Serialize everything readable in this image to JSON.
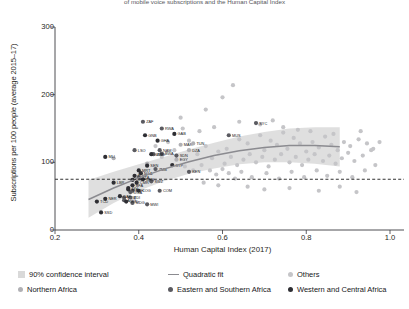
{
  "figure": {
    "title": "of mobile voice subscriptions and the Human Capital Index",
    "xlabel": "Human Capital Index (2017)",
    "ylabel": "Subscriptions per 100 people (average 2015–17)"
  },
  "colors": {
    "band": "#d9d9d9",
    "fit_line": "#8b8b90",
    "others": "#c5c5c8",
    "northern_africa": "#b0b0b4",
    "eastern_southern": "#5a5a60",
    "western_central": "#2e2e33",
    "reference_line": "#1a1a1a",
    "axis": "#3a3a3e"
  },
  "legend": {
    "row1": [
      {
        "label": "90% confidence interval",
        "marker": "swatch",
        "color": "#d9d9d9"
      },
      {
        "label": "Quadratic fit",
        "marker": "line",
        "color": "#8b8b90"
      },
      {
        "label": "Others",
        "marker": "dot",
        "color": "#c5c5c8"
      }
    ],
    "row2": [
      {
        "label": "Northern Africa",
        "marker": "dot",
        "color": "#b0b0b4"
      },
      {
        "label": "Eastern and Southern Africa",
        "marker": "dot",
        "color": "#5a5a60"
      },
      {
        "label": "Western and Central Africa",
        "marker": "dot",
        "color": "#2e2e33"
      }
    ]
  },
  "chart_data": {
    "type": "scatter",
    "title": "of mobile voice subscriptions and the Human Capital Index",
    "xlabel": "Human Capital Index (2017)",
    "ylabel": "Subscriptions per 100 people (average 2015–17)",
    "xlim": [
      0.2,
      1.0
    ],
    "ylim": [
      0,
      300
    ],
    "xticks": [
      0.2,
      0.4,
      0.6,
      0.8,
      1.0
    ],
    "xticklabels": [
      "0.2",
      "0.4",
      "0.6",
      "0.8",
      "1.0"
    ],
    "yticks": [
      0,
      100,
      200,
      300
    ],
    "yticklabels": [
      "0",
      "100",
      "200",
      "300"
    ],
    "grid": false,
    "legend_position": "below",
    "reference_line": {
      "orientation": "horizontal",
      "y": 75,
      "style": "dashed"
    },
    "quadratic_fit": {
      "label": "Quadratic fit",
      "x": [
        0.28,
        0.34,
        0.4,
        0.46,
        0.52,
        0.58,
        0.64,
        0.7,
        0.76,
        0.82,
        0.88
      ],
      "y": [
        45,
        62,
        77,
        90,
        101,
        110,
        117,
        122,
        125,
        125,
        123
      ]
    },
    "confidence_band": {
      "label": "90% confidence interval",
      "level": 90,
      "x": [
        0.28,
        0.34,
        0.4,
        0.46,
        0.52,
        0.58,
        0.64,
        0.7,
        0.76,
        0.82,
        0.88
      ],
      "lower": [
        18,
        40,
        58,
        72,
        83,
        91,
        97,
        100,
        100,
        98,
        94
      ],
      "upper": [
        74,
        86,
        97,
        108,
        119,
        129,
        138,
        145,
        150,
        152,
        152
      ]
    },
    "series": [
      {
        "name": "Western and Central Africa",
        "color": "#2e2e33",
        "points": [
          {
            "label": "MLI",
            "x": 0.32,
            "y": 108
          },
          {
            "label": "GNB",
            "x": 0.415,
            "y": 140
          },
          {
            "label": "GHA",
            "x": 0.445,
            "y": 132
          },
          {
            "label": "GAB",
            "x": 0.485,
            "y": 142
          },
          {
            "label": "TCD",
            "x": 0.3,
            "y": 42
          },
          {
            "label": "NER",
            "x": 0.32,
            "y": 46
          },
          {
            "label": "SSD",
            "x": 0.31,
            "y": 26
          },
          {
            "label": "COD",
            "x": 0.37,
            "y": 42
          },
          {
            "label": "CIV",
            "x": 0.375,
            "y": 62
          },
          {
            "label": "LBR",
            "x": 0.34,
            "y": 70
          },
          {
            "label": "TGO",
            "x": 0.39,
            "y": 80
          },
          {
            "label": "BEN",
            "x": 0.41,
            "y": 75
          },
          {
            "label": "CMR",
            "x": 0.395,
            "y": 70
          },
          {
            "label": "BFA",
            "x": 0.385,
            "y": 66
          },
          {
            "label": "SEN",
            "x": 0.42,
            "y": 95
          },
          {
            "label": "NGA",
            "x": 0.405,
            "y": 84
          },
          {
            "label": "SLE",
            "x": 0.375,
            "y": 60
          },
          {
            "label": "GIN",
            "x": 0.385,
            "y": 74
          },
          {
            "label": "MRT",
            "x": 0.4,
            "y": 88
          },
          {
            "label": "CAF",
            "x": 0.355,
            "y": 50
          },
          {
            "label": "COG",
            "x": 0.4,
            "y": 58
          },
          {
            "label": "GMB",
            "x": 0.43,
            "y": 112
          },
          {
            "label": "STP",
            "x": 0.48,
            "y": 96
          }
        ]
      },
      {
        "name": "Eastern and Southern Africa",
        "color": "#5a5a60",
        "points": [
          {
            "label": "ZAF",
            "x": 0.41,
            "y": 160
          },
          {
            "label": "RWA",
            "x": 0.455,
            "y": 150
          },
          {
            "label": "LSO",
            "x": 0.39,
            "y": 118
          },
          {
            "label": "NAM",
            "x": 0.45,
            "y": 118
          },
          {
            "label": "ZWE",
            "x": 0.435,
            "y": 112
          },
          {
            "label": "BWA",
            "x": 0.455,
            "y": 113
          },
          {
            "label": "ZMB",
            "x": 0.44,
            "y": 90
          },
          {
            "label": "SWZ",
            "x": 0.43,
            "y": 72
          },
          {
            "label": "ETH",
            "x": 0.385,
            "y": 58
          },
          {
            "label": "MDG",
            "x": 0.385,
            "y": 40
          },
          {
            "label": "MOZ",
            "x": 0.365,
            "y": 48
          },
          {
            "label": "MWI",
            "x": 0.42,
            "y": 38
          },
          {
            "label": "COM",
            "x": 0.45,
            "y": 58
          },
          {
            "label": "UGA",
            "x": 0.38,
            "y": 56
          },
          {
            "label": "TZA",
            "x": 0.4,
            "y": 78
          },
          {
            "label": "SYC",
            "x": 0.68,
            "y": 158
          },
          {
            "label": "MUS",
            "x": 0.615,
            "y": 140
          },
          {
            "label": "KEN",
            "x": 0.52,
            "y": 86
          },
          {
            "label": "SDN",
            "x": 0.49,
            "y": 110
          },
          {
            "label": "BDI",
            "x": 0.38,
            "y": 48
          },
          {
            "label": "AGO",
            "x": 0.365,
            "y": 44
          }
        ]
      },
      {
        "name": "Northern Africa",
        "color": "#b0b0b4",
        "points": [
          {
            "label": "MAR",
            "x": 0.5,
            "y": 126
          },
          {
            "label": "DZA",
            "x": 0.52,
            "y": 118
          },
          {
            "label": "EGY",
            "x": 0.49,
            "y": 104
          },
          {
            "label": "TUN",
            "x": 0.53,
            "y": 128
          },
          {
            "label": "",
            "x": 0.34,
            "y": 106
          },
          {
            "label": "",
            "x": 0.42,
            "y": 98
          }
        ]
      },
      {
        "name": "Others",
        "color": "#c5c5c8",
        "points": [
          {
            "x": 0.56,
            "y": 178
          },
          {
            "x": 0.6,
            "y": 196
          },
          {
            "x": 0.625,
            "y": 214
          },
          {
            "x": 0.505,
            "y": 150
          },
          {
            "x": 0.545,
            "y": 146
          },
          {
            "x": 0.58,
            "y": 152
          },
          {
            "x": 0.61,
            "y": 120
          },
          {
            "x": 0.64,
            "y": 134
          },
          {
            "x": 0.66,
            "y": 128
          },
          {
            "x": 0.69,
            "y": 140
          },
          {
            "x": 0.7,
            "y": 118
          },
          {
            "x": 0.715,
            "y": 132
          },
          {
            "x": 0.73,
            "y": 126
          },
          {
            "x": 0.745,
            "y": 144
          },
          {
            "x": 0.755,
            "y": 120
          },
          {
            "x": 0.77,
            "y": 136
          },
          {
            "x": 0.785,
            "y": 128
          },
          {
            "x": 0.8,
            "y": 116
          },
          {
            "x": 0.815,
            "y": 130
          },
          {
            "x": 0.83,
            "y": 122
          },
          {
            "x": 0.845,
            "y": 138
          },
          {
            "x": 0.86,
            "y": 126
          },
          {
            "x": 0.875,
            "y": 118
          },
          {
            "x": 0.89,
            "y": 130
          },
          {
            "x": 0.905,
            "y": 124
          },
          {
            "x": 0.925,
            "y": 134
          },
          {
            "x": 0.945,
            "y": 128
          },
          {
            "x": 0.96,
            "y": 120
          },
          {
            "x": 0.52,
            "y": 132
          },
          {
            "x": 0.54,
            "y": 112
          },
          {
            "x": 0.56,
            "y": 124
          },
          {
            "x": 0.575,
            "y": 106
          },
          {
            "x": 0.59,
            "y": 116
          },
          {
            "x": 0.605,
            "y": 98
          },
          {
            "x": 0.62,
            "y": 108
          },
          {
            "x": 0.635,
            "y": 96
          },
          {
            "x": 0.65,
            "y": 104
          },
          {
            "x": 0.665,
            "y": 112
          },
          {
            "x": 0.68,
            "y": 100
          },
          {
            "x": 0.695,
            "y": 108
          },
          {
            "x": 0.71,
            "y": 94
          },
          {
            "x": 0.725,
            "y": 104
          },
          {
            "x": 0.74,
            "y": 112
          },
          {
            "x": 0.76,
            "y": 100
          },
          {
            "x": 0.775,
            "y": 108
          },
          {
            "x": 0.79,
            "y": 96
          },
          {
            "x": 0.805,
            "y": 104
          },
          {
            "x": 0.82,
            "y": 112
          },
          {
            "x": 0.84,
            "y": 102
          },
          {
            "x": 0.855,
            "y": 110
          },
          {
            "x": 0.87,
            "y": 98
          },
          {
            "x": 0.885,
            "y": 106
          },
          {
            "x": 0.9,
            "y": 114
          },
          {
            "x": 0.915,
            "y": 102
          },
          {
            "x": 0.935,
            "y": 110
          },
          {
            "x": 0.955,
            "y": 118
          },
          {
            "x": 0.47,
            "y": 130
          },
          {
            "x": 0.485,
            "y": 118
          },
          {
            "x": 0.455,
            "y": 108
          },
          {
            "x": 0.44,
            "y": 124
          },
          {
            "x": 0.51,
            "y": 94
          },
          {
            "x": 0.53,
            "y": 88
          },
          {
            "x": 0.55,
            "y": 96
          },
          {
            "x": 0.57,
            "y": 88
          },
          {
            "x": 0.585,
            "y": 82
          },
          {
            "x": 0.6,
            "y": 90
          },
          {
            "x": 0.615,
            "y": 84
          },
          {
            "x": 0.63,
            "y": 76
          },
          {
            "x": 0.645,
            "y": 86
          },
          {
            "x": 0.67,
            "y": 78
          },
          {
            "x": 0.705,
            "y": 84
          },
          {
            "x": 0.735,
            "y": 76
          },
          {
            "x": 0.765,
            "y": 86
          },
          {
            "x": 0.795,
            "y": 78
          },
          {
            "x": 0.825,
            "y": 88
          },
          {
            "x": 0.85,
            "y": 80
          },
          {
            "x": 0.88,
            "y": 86
          },
          {
            "x": 0.91,
            "y": 78
          },
          {
            "x": 0.94,
            "y": 88
          },
          {
            "x": 0.965,
            "y": 96
          },
          {
            "x": 0.66,
            "y": 64
          },
          {
            "x": 0.7,
            "y": 60
          },
          {
            "x": 0.76,
            "y": 62
          },
          {
            "x": 0.83,
            "y": 58
          },
          {
            "x": 0.88,
            "y": 64
          },
          {
            "x": 0.92,
            "y": 56
          },
          {
            "x": 0.59,
            "y": 66
          },
          {
            "x": 0.555,
            "y": 70
          },
          {
            "x": 0.745,
            "y": 152
          },
          {
            "x": 0.78,
            "y": 148
          },
          {
            "x": 0.81,
            "y": 146
          },
          {
            "x": 0.865,
            "y": 142
          },
          {
            "x": 0.93,
            "y": 146
          },
          {
            "x": 0.975,
            "y": 130
          },
          {
            "x": 0.5,
            "y": 166
          },
          {
            "x": 0.64,
            "y": 160
          },
          {
            "x": 0.69,
            "y": 156
          },
          {
            "x": 0.72,
            "y": 162
          }
        ]
      }
    ]
  }
}
